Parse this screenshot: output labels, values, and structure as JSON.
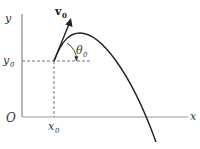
{
  "diagram": {
    "type": "projectile-motion",
    "labels": {
      "y_axis": "y",
      "x_axis": "x",
      "origin": "O",
      "y0": "y",
      "y0_sub": "0",
      "x0": "x",
      "x0_sub": "0",
      "velocity": "v",
      "velocity_sub": "0",
      "angle": "θ",
      "angle_sub": "0"
    },
    "colors": {
      "axis": "#888888",
      "curve": "#222222",
      "dashed": "#666666",
      "text": "#333333"
    }
  }
}
